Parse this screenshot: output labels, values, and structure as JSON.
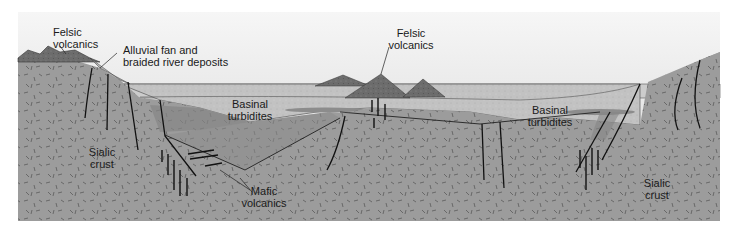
{
  "diagram": {
    "colors": {
      "sky_top": "#f4f4f4",
      "sky_bottom": "#d9d9d9",
      "water": "#cfcfcf",
      "turbidites": "#bdbdbd",
      "crust": "#9a9a9a",
      "mafic": "#8a8a8a",
      "felsic": "#6e6e6e",
      "line": "#1a1a1a"
    },
    "labels": {
      "felsic_left_1": "Felsic",
      "felsic_left_2": "volcanics",
      "alluvial_1": "Alluvial fan and",
      "alluvial_2": "braided river deposits",
      "felsic_center_1": "Felsic",
      "felsic_center_2": "volcanics",
      "basinal_left_1": "Basinal",
      "basinal_left_2": "turbidites",
      "basinal_right_1": "Basinal",
      "basinal_right_2": "turbidites",
      "sialic_left_1": "Sialic",
      "sialic_left_2": "crust",
      "mafic_1": "Mafic",
      "mafic_2": "volcanics",
      "sialic_right_1": "Sialic",
      "sialic_right_2": "crust"
    }
  }
}
